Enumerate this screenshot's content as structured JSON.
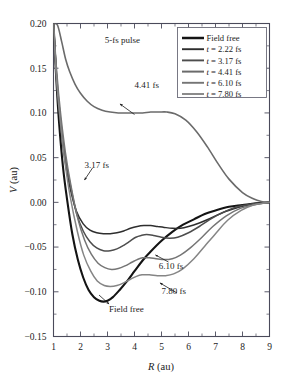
{
  "chart_data": {
    "type": "line",
    "title": "",
    "xlabel": "R (au)",
    "ylabel": "V (au)",
    "xlim": [
      1,
      9
    ],
    "ylim": [
      -0.15,
      0.2
    ],
    "xticks": [
      1,
      2,
      3,
      4,
      5,
      6,
      7,
      8,
      9
    ],
    "xtick_labels": [
      "1",
      "2",
      "3",
      "4",
      "5",
      "6",
      "7",
      "8",
      "9"
    ],
    "yticks": [
      -0.15,
      -0.1,
      -0.05,
      0.0,
      0.05,
      0.1,
      0.15,
      0.2
    ],
    "ytick_labels": [
      "−0.15",
      "−0.10",
      "−0.05",
      "0.00",
      "0.05",
      "0.10",
      "0.15",
      "0.20"
    ],
    "grid": false,
    "legend_position": "top-right",
    "annotations": [
      {
        "text": "5-fs pulse",
        "x": 3.55,
        "y": 0.178
      },
      {
        "text": "4.41 fs",
        "x": 4.45,
        "y": 0.128
      },
      {
        "text": "3.17 fs",
        "x": 2.6,
        "y": 0.038
      },
      {
        "text": "6.10 fs",
        "x": 5.35,
        "y": -0.074
      },
      {
        "text": "7.80 fs",
        "x": 5.45,
        "y": -0.103
      },
      {
        "text": "Field free",
        "x": 3.7,
        "y": -0.123
      }
    ],
    "series": [
      {
        "name": "Field free",
        "color": "#141414",
        "width": 2.1,
        "x": [
          1.0,
          1.1,
          1.2,
          1.35,
          1.5,
          1.7,
          1.9,
          2.1,
          2.3,
          2.5,
          2.7,
          2.85,
          3.0,
          3.2,
          3.45,
          3.7,
          4.0,
          4.3,
          4.6,
          5.0,
          5.4,
          5.8,
          6.2,
          6.6,
          7.0,
          7.5,
          8.0,
          8.5,
          9.0
        ],
        "values": [
          0.2,
          0.14,
          0.092,
          0.04,
          0.004,
          -0.036,
          -0.064,
          -0.084,
          -0.098,
          -0.106,
          -0.11,
          -0.111,
          -0.11,
          -0.106,
          -0.098,
          -0.089,
          -0.077,
          -0.065,
          -0.055,
          -0.043,
          -0.033,
          -0.025,
          -0.019,
          -0.013,
          -0.009,
          -0.005,
          -0.003,
          -0.001,
          0.0
        ]
      },
      {
        "name": "t = 2.22 fs",
        "color": "#2e2e2e",
        "width": 1.5,
        "x": [
          1.0,
          1.12,
          1.25,
          1.42,
          1.6,
          1.85,
          2.1,
          2.35,
          2.6,
          2.85,
          3.1,
          3.35,
          3.6,
          3.85,
          4.1,
          4.35,
          4.6,
          4.85,
          5.1,
          5.4,
          5.7,
          6.0,
          6.4,
          6.8,
          7.3,
          7.8,
          8.3,
          8.7,
          9.0
        ],
        "values": [
          0.2,
          0.135,
          0.09,
          0.048,
          0.018,
          -0.01,
          -0.024,
          -0.031,
          -0.034,
          -0.035,
          -0.035,
          -0.034,
          -0.032,
          -0.029,
          -0.027,
          -0.026,
          -0.026,
          -0.027,
          -0.028,
          -0.029,
          -0.029,
          -0.027,
          -0.023,
          -0.018,
          -0.011,
          -0.006,
          -0.002,
          -0.001,
          0.0
        ]
      },
      {
        "name": "t = 3.17 fs",
        "color": "#4d4d4d",
        "width": 1.5,
        "x": [
          1.0,
          1.12,
          1.25,
          1.42,
          1.62,
          1.85,
          2.1,
          2.35,
          2.6,
          2.85,
          3.1,
          3.35,
          3.6,
          3.85,
          4.05,
          4.25,
          4.45,
          4.7,
          5.0,
          5.3,
          5.6,
          6.0,
          6.4,
          6.8,
          7.3,
          7.8,
          8.3,
          8.7,
          9.0
        ],
        "values": [
          0.2,
          0.14,
          0.096,
          0.054,
          0.02,
          -0.012,
          -0.032,
          -0.044,
          -0.051,
          -0.054,
          -0.054,
          -0.052,
          -0.048,
          -0.043,
          -0.039,
          -0.037,
          -0.036,
          -0.037,
          -0.039,
          -0.04,
          -0.039,
          -0.034,
          -0.027,
          -0.019,
          -0.011,
          -0.005,
          -0.002,
          -0.001,
          0.0
        ]
      },
      {
        "name": "t = 4.41 fs",
        "color": "#6b6b6b",
        "width": 1.6,
        "x": [
          1.0,
          1.15,
          1.3,
          1.45,
          1.6,
          1.8,
          2.0,
          2.25,
          2.5,
          2.8,
          3.1,
          3.4,
          3.7,
          4.0,
          4.3,
          4.6,
          4.9,
          5.2,
          5.5,
          5.9,
          6.3,
          6.7,
          7.1,
          7.5,
          8.0,
          8.4,
          8.7,
          9.0
        ],
        "values": [
          0.2,
          0.198,
          0.18,
          0.16,
          0.146,
          0.132,
          0.122,
          0.113,
          0.107,
          0.103,
          0.101,
          0.1,
          0.1,
          0.1,
          0.1,
          0.101,
          0.101,
          0.101,
          0.099,
          0.092,
          0.079,
          0.062,
          0.043,
          0.026,
          0.011,
          0.004,
          0.001,
          0.0
        ]
      },
      {
        "name": "t = 6.10 fs",
        "color": "#757575",
        "width": 1.5,
        "x": [
          1.0,
          1.12,
          1.26,
          1.44,
          1.65,
          1.9,
          2.15,
          2.4,
          2.65,
          2.9,
          3.15,
          3.4,
          3.65,
          3.9,
          4.1,
          4.3,
          4.55,
          4.8,
          5.1,
          5.4,
          5.7,
          6.1,
          6.5,
          6.9,
          7.4,
          7.9,
          8.4,
          8.75,
          9.0
        ],
        "values": [
          0.2,
          0.146,
          0.1,
          0.056,
          0.018,
          -0.018,
          -0.042,
          -0.058,
          -0.068,
          -0.073,
          -0.075,
          -0.074,
          -0.071,
          -0.067,
          -0.064,
          -0.062,
          -0.062,
          -0.063,
          -0.064,
          -0.063,
          -0.059,
          -0.05,
          -0.039,
          -0.027,
          -0.015,
          -0.007,
          -0.003,
          -0.001,
          0.0
        ]
      },
      {
        "name": "t = 7.80 fs",
        "color": "#858585",
        "width": 1.5,
        "x": [
          1.0,
          1.1,
          1.24,
          1.42,
          1.62,
          1.88,
          2.12,
          2.38,
          2.62,
          2.88,
          3.1,
          3.35,
          3.6,
          3.85,
          4.05,
          4.28,
          4.55,
          4.85,
          5.15,
          5.45,
          5.8,
          6.2,
          6.6,
          7.0,
          7.45,
          7.95,
          8.4,
          8.75,
          9.0
        ],
        "values": [
          0.2,
          0.142,
          0.094,
          0.046,
          0.006,
          -0.032,
          -0.059,
          -0.077,
          -0.088,
          -0.093,
          -0.094,
          -0.093,
          -0.09,
          -0.086,
          -0.083,
          -0.081,
          -0.081,
          -0.082,
          -0.082,
          -0.08,
          -0.074,
          -0.063,
          -0.049,
          -0.035,
          -0.02,
          -0.009,
          -0.003,
          -0.001,
          0.0
        ]
      }
    ]
  },
  "legend": {
    "items": [
      {
        "label": "Field free"
      },
      {
        "label": "t = 2.22 fs"
      },
      {
        "label": "t = 3.17 fs"
      },
      {
        "label": "t = 4.41 fs"
      },
      {
        "label": "t = 6.10 fs"
      },
      {
        "label": "t = 7.80 fs"
      }
    ]
  },
  "axes": {
    "x_title_italic": "R",
    "x_title_unit": " (au)",
    "y_title_italic": "V",
    "y_title_unit": " (au)"
  }
}
